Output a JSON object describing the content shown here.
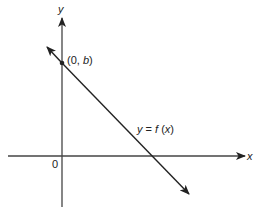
{
  "diagram": {
    "type": "coordinate-plane-line",
    "axes": {
      "x_label": "x",
      "y_label": "y",
      "origin_label": "0"
    },
    "point": {
      "label_open": "(0, ",
      "label_var": "b",
      "label_close": ")"
    },
    "line": {
      "label_y": "y",
      "label_eq": " = ",
      "label_f": "f",
      "label_arg_open": " (",
      "label_arg": "x",
      "label_arg_close": ")"
    },
    "colors": {
      "stroke": "#222222",
      "background": "#ffffff"
    }
  }
}
